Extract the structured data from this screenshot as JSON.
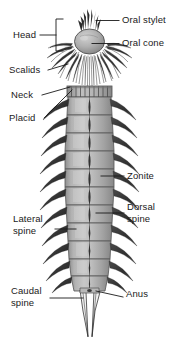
{
  "figure": {
    "type": "labeled-anatomical-diagram",
    "background_color": "#ffffff",
    "ink_color": "#1a1a1a",
    "body_fill": "#a8a8a8",
    "body_fill_light": "#c4c4c4",
    "body_fill_dark": "#7d7d7d",
    "spine_color": "#3a3a3a",
    "width": 182,
    "height": 339
  },
  "labels": [
    {
      "id": "oral-stylet",
      "text": "Oral stylet",
      "x": 122,
      "y": 16,
      "side": "right"
    },
    {
      "id": "oral-cone",
      "text": "Oral cone",
      "x": 122,
      "y": 39,
      "side": "right"
    },
    {
      "id": "head",
      "text": "Head",
      "x": 14,
      "y": 30,
      "side": "left"
    },
    {
      "id": "scalids",
      "text": "Scalids",
      "x": 10,
      "y": 66,
      "side": "left"
    },
    {
      "id": "neck",
      "text": "Neck",
      "x": 12,
      "y": 91,
      "side": "left"
    },
    {
      "id": "placid",
      "text": "Placid",
      "x": 10,
      "y": 115,
      "side": "left"
    },
    {
      "id": "zonite",
      "text": "Zonite",
      "x": 127,
      "y": 172,
      "side": "right"
    },
    {
      "id": "dorsal-spine",
      "text": "Dorsal\nspine",
      "x": 127,
      "y": 204,
      "side": "right"
    },
    {
      "id": "lateral-spine",
      "text": "Lateral\nspine",
      "x": 14,
      "y": 216,
      "side": "left"
    },
    {
      "id": "caudal-spine",
      "text": "Caudal\nspine",
      "x": 12,
      "y": 287,
      "side": "left"
    },
    {
      "id": "anus",
      "text": "Anus",
      "x": 126,
      "y": 290,
      "side": "right"
    }
  ],
  "leader_lines": [
    {
      "id": "leader-oral-stylet",
      "from": "oral stylet tip",
      "to": "label oral-stylet"
    },
    {
      "id": "leader-oral-cone",
      "from": "oral cone body",
      "to": "label oral-cone"
    },
    {
      "id": "leader-head-bracket",
      "from": "head region bracket",
      "to": "label head"
    },
    {
      "id": "leader-scalids",
      "from": "scalid spines",
      "to": "label scalids"
    },
    {
      "id": "leader-neck",
      "from": "neck segment",
      "to": "label neck"
    },
    {
      "id": "leader-placid",
      "from": "placid plate",
      "to": "label placid"
    },
    {
      "id": "leader-zonite",
      "from": "trunk zonite",
      "to": "label zonite"
    },
    {
      "id": "leader-dorsal-spine",
      "from": "dorsal midline spine",
      "to": "label dorsal-spine"
    },
    {
      "id": "leader-lateral-spine",
      "from": "lateral spine",
      "to": "label lateral-spine"
    },
    {
      "id": "leader-caudal-spine",
      "from": "caudal spine",
      "to": "label caudal-spine"
    },
    {
      "id": "leader-anus",
      "from": "anus",
      "to": "label anus"
    }
  ],
  "anatomy": {
    "segment_count": 11,
    "parts": [
      "oral stylet",
      "oral cone",
      "head",
      "scalids",
      "neck",
      "placid",
      "zonite",
      "dorsal spine",
      "lateral spine",
      "caudal spine",
      "anus"
    ]
  }
}
